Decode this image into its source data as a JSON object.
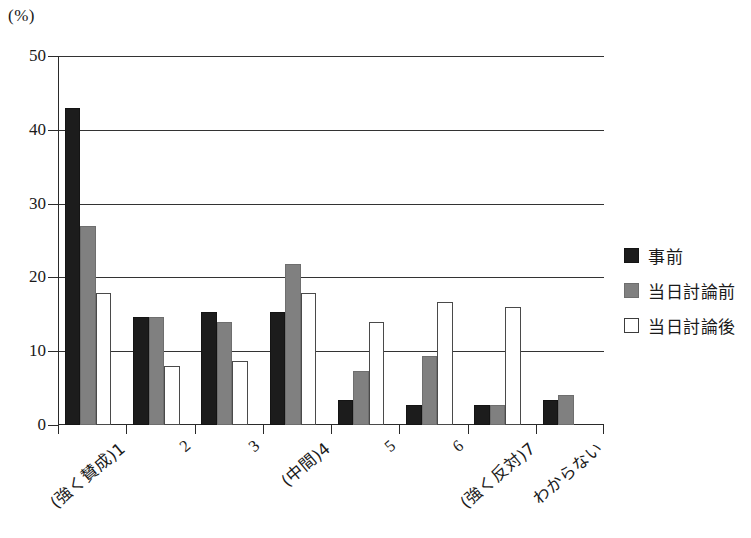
{
  "chart_data": {
    "type": "bar",
    "title": "",
    "xlabel": "",
    "ylabel": "(%)",
    "ylim": [
      0,
      50
    ],
    "yticks": [
      0,
      10,
      20,
      30,
      40,
      50
    ],
    "ytick_labels": [
      "0",
      "10",
      "20",
      "30",
      "40",
      "50"
    ],
    "grid": true,
    "legend_position": "right",
    "categories": [
      "(強く賛成)1",
      "2",
      "3",
      "(中間)4",
      "5",
      "6",
      "(強く反対)7",
      "わからない"
    ],
    "series": [
      {
        "name": "事前",
        "color": "#1c1c1c",
        "values": [
          43.0,
          14.6,
          15.3,
          15.3,
          3.4,
          2.7,
          2.7,
          3.4
        ]
      },
      {
        "name": "当日討論前",
        "color": "#808080",
        "values": [
          27.0,
          14.6,
          13.9,
          21.8,
          7.3,
          9.3,
          2.7,
          4.1
        ]
      },
      {
        "name": "当日討論後",
        "color": "#ffffff",
        "values": [
          17.9,
          8.0,
          8.7,
          17.9,
          14.0,
          16.7,
          16.0,
          0
        ]
      }
    ]
  },
  "legend": {
    "items": [
      {
        "label": "事前",
        "swatch": "filled-black-square-icon"
      },
      {
        "label": "当日討論前",
        "swatch": "filled-gray-square-icon"
      },
      {
        "label": "当日討論後",
        "swatch": "open-white-square-icon"
      }
    ]
  },
  "axes": {
    "unit_label": "(%)"
  }
}
